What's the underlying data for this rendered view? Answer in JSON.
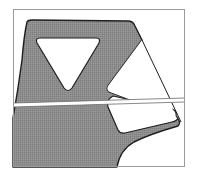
{
  "diagram": {
    "type": "cross-section-drawing",
    "frame": {
      "x": 13,
      "y": 9,
      "width": 172,
      "height": 158,
      "stroke": "#9a9a9a"
    },
    "colors": {
      "fill": "#8c8c8c",
      "outline": "#1e1e1e",
      "background": "#ffffff",
      "cut_band": "#ffffff"
    },
    "elements": [
      {
        "id": "solid-body",
        "label": "",
        "kind": "filled-polygon"
      },
      {
        "id": "triangle-cutout",
        "label": "",
        "kind": "hole"
      },
      {
        "id": "wedge-cutout",
        "label": "",
        "kind": "hole"
      },
      {
        "id": "cut-plane-band",
        "label": "",
        "kind": "section-line"
      },
      {
        "id": "chord-line",
        "label": "",
        "kind": "line"
      }
    ]
  }
}
